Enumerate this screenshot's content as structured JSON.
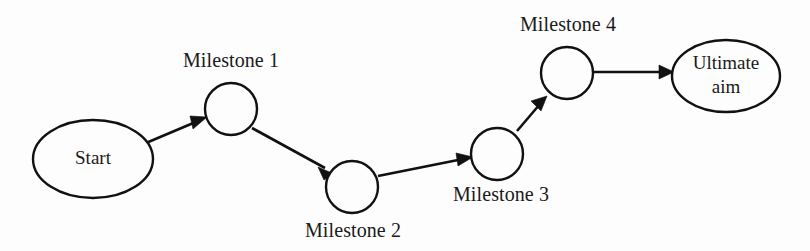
{
  "diagram": {
    "type": "flowchart",
    "orientation": "left-to-right",
    "background_color": "#fdfdfd",
    "line_color": "#111111",
    "nodes": [
      {
        "id": "start",
        "label": "Start",
        "shape": "ellipse",
        "cx": 93,
        "cy": 159,
        "rx": 60,
        "ry": 39,
        "label_lines": [
          "Start"
        ],
        "caption": null
      },
      {
        "id": "milestone1",
        "label": "Milestone 1",
        "shape": "circle",
        "cx": 231,
        "cy": 109,
        "r": 26,
        "label_lines": [],
        "caption": "Milestone 1",
        "caption_x": 231,
        "caption_y": 62,
        "caption_position": "above"
      },
      {
        "id": "milestone2",
        "label": "Milestone 2",
        "shape": "circle",
        "cx": 352,
        "cy": 187,
        "r": 26,
        "label_lines": [],
        "caption": "Milestone 2",
        "caption_x": 353,
        "caption_y": 232,
        "caption_position": "below"
      },
      {
        "id": "milestone3",
        "label": "Milestone 3",
        "shape": "circle",
        "cx": 497,
        "cy": 154,
        "r": 26,
        "label_lines": [],
        "caption": "Milestone 3",
        "caption_x": 501,
        "caption_y": 196,
        "caption_position": "below"
      },
      {
        "id": "milestone4",
        "label": "Milestone 4",
        "shape": "circle",
        "cx": 567,
        "cy": 73,
        "r": 26,
        "label_lines": [],
        "caption": "Milestone 4",
        "caption_x": 568,
        "caption_y": 26,
        "caption_position": "above"
      },
      {
        "id": "ultimateaim",
        "label": "Ultimate aim",
        "shape": "ellipse",
        "cx": 726,
        "cy": 76,
        "rx": 54,
        "ry": 36,
        "label_lines": [
          "Ultimate",
          "aim"
        ],
        "caption": null
      }
    ],
    "edges": [
      {
        "id": "edge-start-m1",
        "from": "start",
        "to": "milestone1",
        "x1": 146,
        "y1": 143,
        "x2": 207,
        "y2": 117,
        "direction": "up-right"
      },
      {
        "id": "edge-m1-m2",
        "from": "milestone1",
        "to": "milestone2",
        "x1": 252,
        "y1": 128,
        "x2": 333,
        "y2": 173,
        "direction": "down-right"
      },
      {
        "id": "edge-m2-m3",
        "from": "milestone2",
        "to": "milestone3",
        "x1": 378,
        "y1": 176,
        "x2": 472,
        "y2": 157,
        "direction": "up-right"
      },
      {
        "id": "edge-m3-m4",
        "from": "milestone3",
        "to": "milestone4",
        "x1": 517,
        "y1": 131,
        "x2": 547,
        "y2": 96,
        "direction": "up-right"
      },
      {
        "id": "edge-m4-aim",
        "from": "milestone4",
        "to": "ultimateaim",
        "x1": 594,
        "y1": 72,
        "x2": 673,
        "y2": 72,
        "direction": "right"
      }
    ]
  }
}
